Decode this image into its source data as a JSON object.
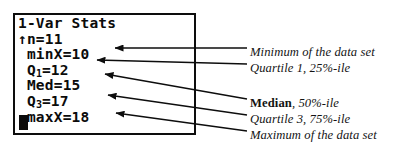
{
  "calculator": {
    "title": "1-Var Stats",
    "scroll_indicator": "↑",
    "lines": [
      {
        "id": "title",
        "text": "1-Var Stats"
      },
      {
        "id": "n",
        "text": "↑n=11"
      },
      {
        "id": "minX",
        "text": " minX=10"
      },
      {
        "id": "Q1",
        "prefix": " Q",
        "sub": "1",
        "suffix": "=12"
      },
      {
        "id": "Med",
        "text": " Med=15"
      },
      {
        "id": "Q3",
        "prefix": " Q",
        "sub": "3",
        "suffix": "=17"
      },
      {
        "id": "maxX",
        "text": " maxX=18"
      }
    ],
    "values": {
      "n": 11,
      "minX": 10,
      "Q1": 12,
      "Med": 15,
      "Q3": 17,
      "maxX": 18
    },
    "cursor": "block-cursor"
  },
  "annotations": [
    {
      "id": "min",
      "text": "Minimum of the data set",
      "bold_lead": ""
    },
    {
      "id": "q1",
      "text": "Quartile 1,  25%-ile",
      "bold_lead": ""
    },
    {
      "id": "median",
      "bold_lead": "Median",
      "text": ", 50%-ile"
    },
    {
      "id": "q3",
      "text": "Quartile 3, 75%-ile",
      "bold_lead": ""
    },
    {
      "id": "max",
      "text": "Maximum of the data set",
      "bold_lead": ""
    }
  ],
  "colors": {
    "ink": "#0b0b0b",
    "background": "#ffffff",
    "text": "#131313"
  }
}
